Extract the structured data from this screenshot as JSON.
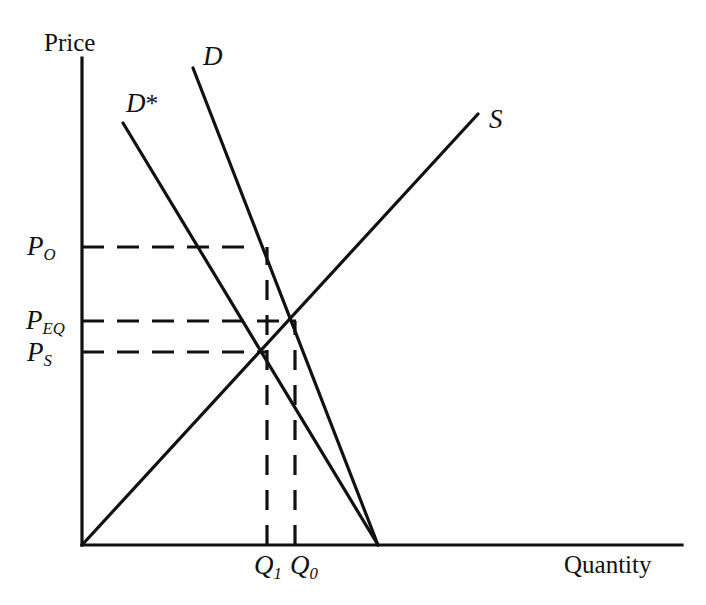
{
  "figure": {
    "kind": "supply-demand-diagram",
    "background_color": "#ffffff",
    "line_color": "#111111"
  },
  "axes": {
    "y_label": "Price",
    "x_label": "Quantity",
    "origin": [
      82,
      545
    ],
    "y_axis_top": [
      82,
      58
    ],
    "x_axis_right": [
      682,
      545
    ]
  },
  "curves": {
    "supply": {
      "label": "S",
      "from": [
        82,
        545
      ],
      "to": [
        478,
        114
      ]
    },
    "demand": {
      "label": "D",
      "from": [
        193,
        68
      ],
      "to": [
        378,
        545
      ]
    },
    "demand_star": {
      "label": "D*",
      "label_base": "D",
      "label_mark": "*",
      "from": [
        123,
        123
      ],
      "to": [
        378,
        545
      ]
    }
  },
  "price_levels": [
    {
      "id": "p0",
      "base": "P",
      "sub": "O",
      "y": 247,
      "x_end": 250
    },
    {
      "id": "peq",
      "base": "P",
      "sub": "EQ",
      "y": 321,
      "x_end": 294
    },
    {
      "id": "ps",
      "base": "P",
      "sub": "S",
      "y": 352,
      "x_end": 265
    }
  ],
  "quantity_levels": [
    {
      "id": "q1",
      "base": "Q",
      "sub": "1",
      "x": 267,
      "y_top": 247
    },
    {
      "id": "q0",
      "base": "Q",
      "sub": "0",
      "x": 295,
      "y_top": 321
    }
  ],
  "chart_data": {
    "type": "line",
    "title": "",
    "xlabel": "Quantity",
    "ylabel": "Price",
    "grid": false,
    "legend": "none",
    "annotations": [
      "D",
      "D*",
      "S",
      "P_O",
      "P_EQ",
      "P_S",
      "Q_1",
      "Q_0"
    ],
    "series": [
      {
        "name": "S",
        "role": "supply",
        "slope": "upward",
        "points": [
          [
            82,
            545
          ],
          [
            478,
            114
          ]
        ]
      },
      {
        "name": "D",
        "role": "demand-original",
        "slope": "downward",
        "points": [
          [
            193,
            68
          ],
          [
            378,
            545
          ]
        ]
      },
      {
        "name": "D*",
        "role": "demand-shifted",
        "slope": "downward",
        "points": [
          [
            123,
            123
          ],
          [
            378,
            545
          ]
        ]
      }
    ],
    "equilibria": [
      {
        "name": "D x S",
        "price_label": "P_EQ",
        "quantity_label": "Q_0",
        "point": [
          294,
          321
        ]
      },
      {
        "name": "D* x S",
        "price_label": "P_S",
        "quantity_label": "Q_1",
        "point": [
          265,
          352
        ]
      },
      {
        "name": "D at P_O",
        "price_label": "P_O",
        "quantity_label": "Q_1",
        "point": [
          250,
          247
        ]
      }
    ],
    "price_axis_marks": [
      "P_O",
      "P_EQ",
      "P_S"
    ],
    "quantity_axis_marks": [
      "Q_1",
      "Q_0"
    ]
  }
}
